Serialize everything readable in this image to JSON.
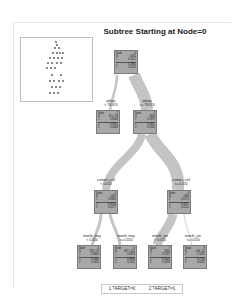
{
  "title": "Subtree Starting at Node=0",
  "colors": {
    "node_fill": "#a8a8a8",
    "branch": "#c4c4c4",
    "border": "#7a7a7a"
  },
  "nodes": [
    {
      "id": "n0",
      "label": "Node",
      "num": "0",
      "l1k": "N",
      "l1v": "4561",
      "l2k": "1",
      "l2v": "0.5012",
      "l3k": "1",
      "l3v": "0.4882",
      "l4k": "2",
      "l4v": "0.5024"
    },
    {
      "id": "n1",
      "label": "Node",
      "num": "1",
      "l1k": "N",
      "l1v": "921 / 93",
      "l2k": "2",
      "l2v": "0.8448",
      "l3k": "1",
      "l3v": "0.9552",
      "l4k": "2",
      "l4v": "0.0448"
    },
    {
      "id": "n2",
      "label": "Node",
      "num": "2",
      "l1k": "N",
      "l1v": "3640",
      "l2k": "1",
      "l2v": "0.4371",
      "l3k": "1",
      "l3v": "0.5651",
      "l4k": "2",
      "l4v": "0.4349"
    },
    {
      "id": "n3",
      "label": "Node",
      "num": "3",
      "l1k": "N",
      "l1v": "1602",
      "l2k": "1",
      "l2v": "0.8083",
      "l3k": "1",
      "l3v": "0.8083",
      "l4k": "2",
      "l4v": "0.0277"
    },
    {
      "id": "n4",
      "label": "Node",
      "num": "4",
      "l1k": "N",
      "l1v": "1638",
      "l2k": "2",
      "l2v": "0.6712",
      "l3k": "1",
      "l3v": "0.4697",
      "l4k": "2",
      "l4v": "0.6512"
    },
    {
      "id": "n5",
      "label": "Node",
      "num": "5",
      "l1k": "N",
      "l1v": "826 / 28",
      "l2k": "1",
      "l2v": "0.9600",
      "l3k": "1",
      "l3v": "0.9600",
      "l4k": "2",
      "l4v": "0.0400"
    },
    {
      "id": "n6",
      "label": "Node",
      "num": "6",
      "l1k": "N",
      "l1v": "621 / 161",
      "l2k": "1",
      "l2v": "0.8839",
      "l3k": "1",
      "l3v": "0.8839",
      "l4k": "2",
      "l4v": "0.1161"
    },
    {
      "id": "n7",
      "label": "Node",
      "num": "7",
      "l1k": "N",
      "l1v": "2691",
      "l2k": "1",
      "l2v": "0.5587",
      "l3k": "1",
      "l3v": "0.5040",
      "l4k": "2",
      "l4v": "0.4418"
    },
    {
      "id": "n8",
      "label": "Node",
      "num": "8",
      "l1k": "N",
      "l1v": "146 / 15",
      "l2k": "2",
      "l2v": "0.5481",
      "l3k": "1",
      "l3v": "0.2700",
      "l4k": "2",
      "l4v": "0.6481"
    }
  ],
  "splits": [
    {
      "var": "pdays",
      "cond": "< 78.070"
    },
    {
      "var": "pdays",
      "cond": ">= 78.070"
    },
    {
      "var": "contact_cell",
      "cond": "< 0.010"
    },
    {
      "var": "contact_cell",
      "cond": ">= 0.010"
    },
    {
      "var": "month_may",
      "cond": "< 0.010"
    },
    {
      "var": "month_may",
      "cond": ">= 0.010"
    },
    {
      "var": "month_jun",
      "cond": "< 0.010"
    },
    {
      "var": "month_jun",
      "cond": ">= 0.010"
    }
  ],
  "legend": {
    "item1": "1  TARGET=0",
    "item2": "2  TARGET=1"
  }
}
